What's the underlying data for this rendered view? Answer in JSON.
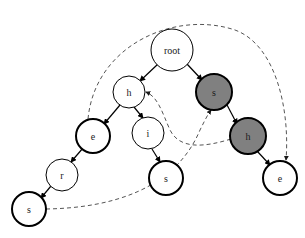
{
  "diagram": {
    "canvas": {
      "width": 305,
      "height": 238,
      "background": "#ffffff"
    },
    "colors": {
      "node_fill_white": "#ffffff",
      "node_fill_gray": "#808080",
      "stroke": "#000000",
      "dashed_stroke": "#555555",
      "label": "#1a1a1a"
    },
    "nodes": [
      {
        "id": "root",
        "label": "root",
        "cx": 172,
        "cy": 50,
        "r": 21,
        "fill": "#ffffff",
        "stroke_width": 1.0,
        "font_size": 10
      },
      {
        "id": "h1",
        "label": "h",
        "cx": 129,
        "cy": 92,
        "r": 16,
        "fill": "#ffffff",
        "stroke_width": 1.0,
        "font_size": 10
      },
      {
        "id": "s_gray",
        "label": "s",
        "cx": 214,
        "cy": 92,
        "r": 18,
        "fill": "#808080",
        "stroke_width": 2.0,
        "font_size": 10
      },
      {
        "id": "e1",
        "label": "e",
        "cx": 93,
        "cy": 136,
        "r": 17,
        "fill": "#ffffff",
        "stroke_width": 2.0,
        "font_size": 10
      },
      {
        "id": "i1",
        "label": "i",
        "cx": 148,
        "cy": 133,
        "r": 16,
        "fill": "#ffffff",
        "stroke_width": 1.0,
        "font_size": 10
      },
      {
        "id": "h_gray",
        "label": "h",
        "cx": 248,
        "cy": 136,
        "r": 18,
        "fill": "#808080",
        "stroke_width": 2.0,
        "font_size": 10
      },
      {
        "id": "r1",
        "label": "r",
        "cx": 62,
        "cy": 175,
        "r": 16,
        "fill": "#ffffff",
        "stroke_width": 1.0,
        "font_size": 10
      },
      {
        "id": "s_mid",
        "label": "s",
        "cx": 166,
        "cy": 178,
        "r": 17,
        "fill": "#ffffff",
        "stroke_width": 2.0,
        "font_size": 10
      },
      {
        "id": "e2",
        "label": "e",
        "cx": 280,
        "cy": 178,
        "r": 17,
        "fill": "#ffffff",
        "stroke_width": 2.0,
        "font_size": 10
      },
      {
        "id": "s_low",
        "label": "s",
        "cx": 29,
        "cy": 209,
        "r": 17,
        "fill": "#ffffff",
        "stroke_width": 2.0,
        "font_size": 10
      }
    ],
    "solid_edges": [
      {
        "from": "root",
        "to": "h1",
        "path": "M 158 64 L 140 81"
      },
      {
        "from": "root",
        "to": "s_gray",
        "path": "M 187 64 L 202 80"
      },
      {
        "from": "h1",
        "to": "e1",
        "path": "M 120 105 L 104 124"
      },
      {
        "from": "h1",
        "to": "i1",
        "path": "M 134 107 L 143 118"
      },
      {
        "from": "e1",
        "to": "r1",
        "path": "M 83 148 L 71 162"
      },
      {
        "from": "r1",
        "to": "s_low",
        "path": "M 51 186 L 41 198"
      },
      {
        "from": "i1",
        "to": "s_mid",
        "path": "M 152 149 L 160 162"
      },
      {
        "from": "s_gray",
        "to": "h_gray",
        "path": "M 226 103 L 237 124"
      },
      {
        "from": "h_gray",
        "to": "e2",
        "path": "M 257 151 L 270 165"
      }
    ],
    "dashed_edges": [
      {
        "from": "e1",
        "to": "e2",
        "path": "M 88 119 C 95 45 175 10 235 30 C 276 45 290 110 286 160"
      },
      {
        "from": "s_low",
        "to": "s_gray",
        "path": "M 46 209 C 110 208 175 190 200 130 C 205 120 208 114 211 110"
      },
      {
        "from": "h_gray",
        "to": "h1",
        "path": "M 231 139 C 205 147 180 150 170 130 C 162 112 158 97 146 92"
      }
    ],
    "legend": {
      "solid_meaning": "tree edge",
      "dashed_meaning": "suffix link"
    }
  }
}
